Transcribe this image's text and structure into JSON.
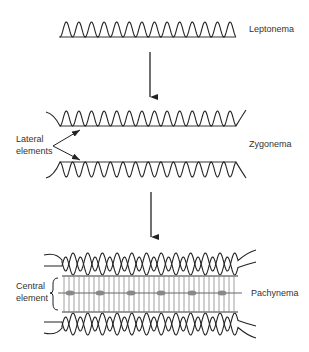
{
  "stages": [
    {
      "id": "leptonema",
      "label": "Leptonema"
    },
    {
      "id": "zygonema",
      "label": "Zygonema"
    },
    {
      "id": "pachynema",
      "label": "Pachynema"
    }
  ],
  "annotations": {
    "lateral_line1": "Lateral",
    "lateral_line2": "elements",
    "central_line1": "Central",
    "central_line2": "element"
  },
  "colors": {
    "stroke": "#222222",
    "axis": "#777777",
    "dash": "#888888"
  }
}
